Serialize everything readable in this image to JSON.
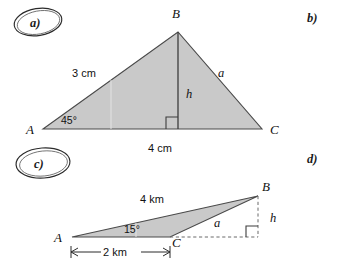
{
  "page": {
    "width": 337,
    "height": 266,
    "background": "#ffffff"
  },
  "colors": {
    "triangle_fill": "#c9c9c9",
    "triangle_stroke": "#4a4a4a",
    "text": "#111111",
    "dashed": "#6b6b6b",
    "annotation": "#2b2b2b"
  },
  "exercise_labels": {
    "a": "a)",
    "b": "b)",
    "c": "c)",
    "d": "d)"
  },
  "figure_a": {
    "caption": "a)",
    "circled": true,
    "type": "triangle",
    "vertices": {
      "A": "A",
      "B": "B",
      "C": "C"
    },
    "side_labels": {
      "AB": "3 cm",
      "BC": "a",
      "AC": "4 cm",
      "altitude": "h"
    },
    "angle_labels": {
      "A": "45°",
      "foot_of_altitude": "right angle"
    },
    "geometry": {
      "A": [
        43,
        129
      ],
      "B": [
        178,
        32
      ],
      "C": [
        262,
        129
      ],
      "altitude_foot": [
        178,
        129
      ]
    }
  },
  "figure_c": {
    "caption": "c)",
    "circled": true,
    "type": "triangle",
    "vertices": {
      "A": "A",
      "B": "B",
      "C": "C"
    },
    "side_labels": {
      "AB": "4 km",
      "CB": "a",
      "AC": "2 km",
      "altitude": "h"
    },
    "angle_labels": {
      "A": "15°",
      "foot_of_altitude": "right angle"
    },
    "geometry": {
      "A": [
        72,
        237
      ],
      "B": [
        258,
        196
      ],
      "C": [
        170,
        237
      ],
      "altitude_foot": [
        258,
        237
      ]
    }
  },
  "icons": {
    "right_angle_marker": "right-angle-icon",
    "dimension_arrow": "dimension-arrow-icon",
    "hand_circle": "hand-drawn-ellipse-icon"
  }
}
